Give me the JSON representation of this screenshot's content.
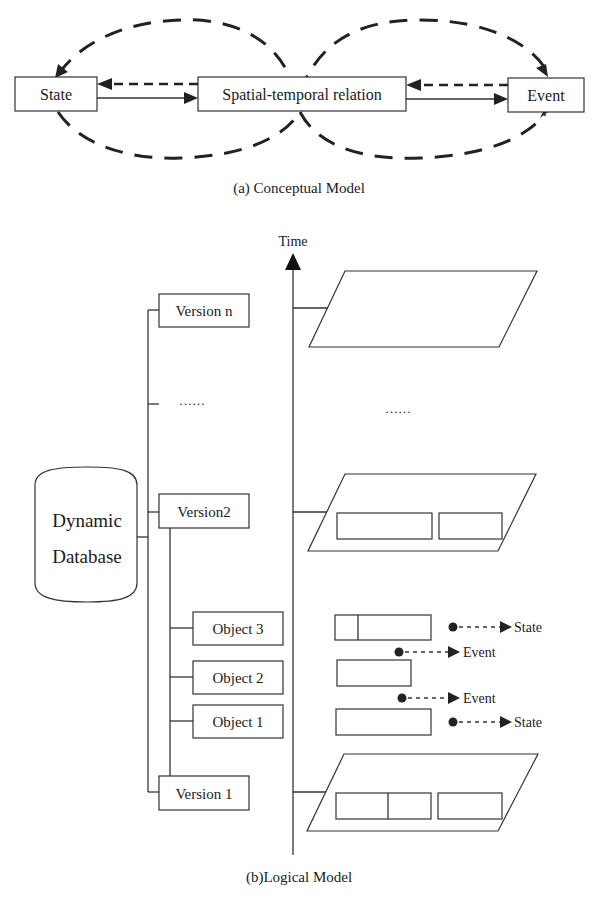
{
  "conceptual_model": {
    "caption": "(a) Conceptual Model",
    "nodes": {
      "state": "State",
      "relation": "Spatial-temporal relation",
      "event": "Event"
    }
  },
  "logical_model": {
    "caption": "(b)Logical Model",
    "axis_label": "Time",
    "database": {
      "line1": "Dynamic",
      "line2": "Database"
    },
    "versions": {
      "n": "Version n",
      "ellipsis": "……",
      "v2": "Version2",
      "v1": "Version 1"
    },
    "objects": {
      "o3": "Object 3",
      "o2": "Object 2",
      "o1": "Object 1"
    },
    "ellipsis_right": "……",
    "transitions": [
      {
        "label": "State"
      },
      {
        "label": "Event"
      },
      {
        "label": "Event"
      },
      {
        "label": "State"
      }
    ]
  }
}
